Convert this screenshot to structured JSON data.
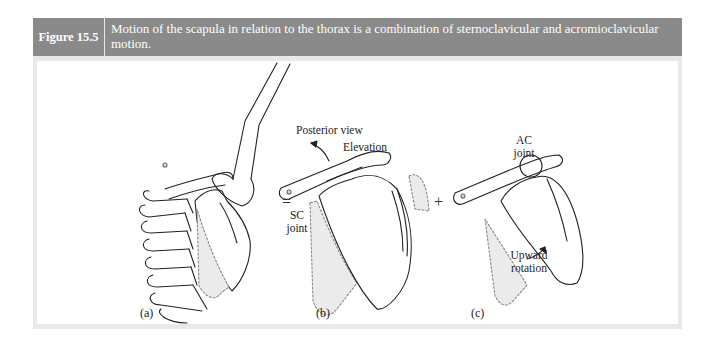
{
  "figure": {
    "number_label": "Figure 15.5",
    "caption": "Motion of the scapula in relation to the thorax is a combination of sternoclavicular and acromioclavicular motion.",
    "header_color": "#8a8a8a",
    "border_color": "#e9e9e9"
  },
  "panels": {
    "a": {
      "label": "(a)"
    },
    "b": {
      "label": "(b)",
      "view_title": "Posterior view",
      "motion_label": "Elevation",
      "joint_label_line1": "SC",
      "joint_label_line2": "joint"
    },
    "c": {
      "label": "(c)",
      "joint_label_line1": "AC",
      "joint_label_line2": "joint",
      "motion_label_line1": "Upward",
      "motion_label_line2": "rotation"
    }
  },
  "operators": {
    "equals": "=",
    "plus": "+"
  }
}
